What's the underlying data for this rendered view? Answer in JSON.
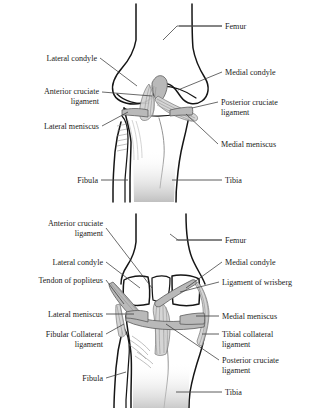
{
  "document": {
    "title": "Knee joint ligament anatomy",
    "background_color": "#ffffff",
    "text_color": "#1b1b1b",
    "leader_line_color": "#3a3a3a",
    "bone_outline_color": "#151515",
    "ligament_fill_color": "#d2d2d2"
  },
  "figures": [
    {
      "id": "anterior",
      "view": "anterior view of right knee",
      "labels_left": [
        {
          "text": "Lateral condyle"
        },
        {
          "text": "Anterior cruciate"
        },
        {
          "text": "ligament"
        },
        {
          "text": "Lateral meniscus"
        },
        {
          "text": "Fibula"
        }
      ],
      "labels_right": [
        {
          "text": "Femur"
        },
        {
          "text": "Medial condyle"
        },
        {
          "text": "Posterior cruciate"
        },
        {
          "text": "ligament"
        },
        {
          "text": "Medial meniscus"
        },
        {
          "text": "Tibia"
        }
      ]
    },
    {
      "id": "posterior",
      "view": "posterior view of right knee",
      "labels_left": [
        {
          "text": "Anterior cruciate"
        },
        {
          "text": "ligament"
        },
        {
          "text": "Lateral condyle"
        },
        {
          "text": "Tendon of popliteus"
        },
        {
          "text": "Lateral meniscus"
        },
        {
          "text": "Fibular Collateral"
        },
        {
          "text": "ligament"
        },
        {
          "text": "Fibula"
        }
      ],
      "labels_right": [
        {
          "text": "Femur"
        },
        {
          "text": "Medial condyle"
        },
        {
          "text": "Ligament of wrisberg"
        },
        {
          "text": "Medial meniscus"
        },
        {
          "text": "Tibial collateral"
        },
        {
          "text": "ligament"
        },
        {
          "text": "Posterior cruciate"
        },
        {
          "text": "ligament"
        },
        {
          "text": "Tibia"
        }
      ]
    }
  ]
}
